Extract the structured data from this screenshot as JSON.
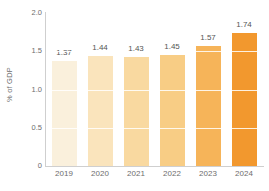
{
  "chart_data": {
    "type": "bar",
    "title": "",
    "subtitle": "",
    "xlabel": "",
    "ylabel": "% of GDP",
    "categories": [
      "2019",
      "2020",
      "2021",
      "2022",
      "2023",
      "2024"
    ],
    "values": [
      1.37,
      1.44,
      1.43,
      1.45,
      1.57,
      1.74
    ],
    "value_labels": [
      "1.37",
      "1.44",
      "1.43",
      "1.45",
      "1.57",
      "1.74"
    ],
    "ylim": [
      0,
      2.0
    ],
    "y_ticks": [
      0,
      0.5,
      1.0,
      1.5,
      2.0
    ],
    "y_tick_labels": [
      "0",
      "0.5",
      "1.0",
      "1.5",
      "2.0"
    ],
    "grid": "horizontal-white-overlay",
    "legend": "none",
    "bar_colors": [
      "#faf0dc",
      "#fae4bc",
      "#f9d9a0",
      "#f8cd85",
      "#f6b459",
      "#f2982e"
    ],
    "axis_color": "#cfcfcf",
    "text_color": "#6d6d6d",
    "value_label_color": "#555555",
    "background": "#ffffff"
  }
}
